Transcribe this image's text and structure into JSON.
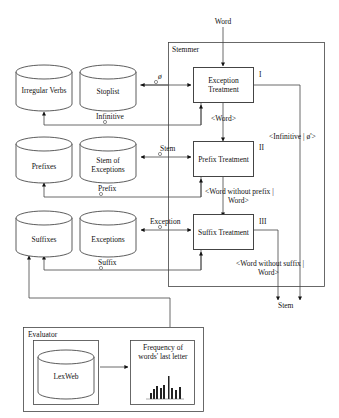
{
  "input_label": "Word",
  "stemmer": {
    "title": "Stemmer",
    "stages": [
      {
        "numeral": "I",
        "label": "Exception Treatment"
      },
      {
        "numeral": "II",
        "label": "Prefix Treatment"
      },
      {
        "numeral": "III",
        "label": "Suffix Treatment"
      }
    ],
    "flows": {
      "i_to_ii": "<Word>",
      "ii_to_iii_line1": "<Word without prefix |",
      "ii_to_iii_line2": "Word>",
      "iii_out_line1": "<Word without suffix |",
      "iii_out_line2": "Word>",
      "i_out": "<Infinitive | ø'>"
    }
  },
  "output_label": "Stem",
  "databases": {
    "irregular_verbs": "Irregular Verbs",
    "stoplist": "Stoplist",
    "prefixes": "Prefixes",
    "stem_of_exceptions": "Stem of Exceptions",
    "suffixes": "Suffixes",
    "exceptions": "Exceptions"
  },
  "edge_labels": {
    "empty": "ø",
    "infinitive": "Infinitive",
    "stem": "Stem",
    "prefix": "Prefix",
    "exception": "Exception",
    "suffix": "Suffix"
  },
  "evaluator": {
    "title": "Evaluator",
    "database": "LexWeb",
    "chart_label_line1": "Frequency of",
    "chart_label_line2": "words' last letter"
  }
}
